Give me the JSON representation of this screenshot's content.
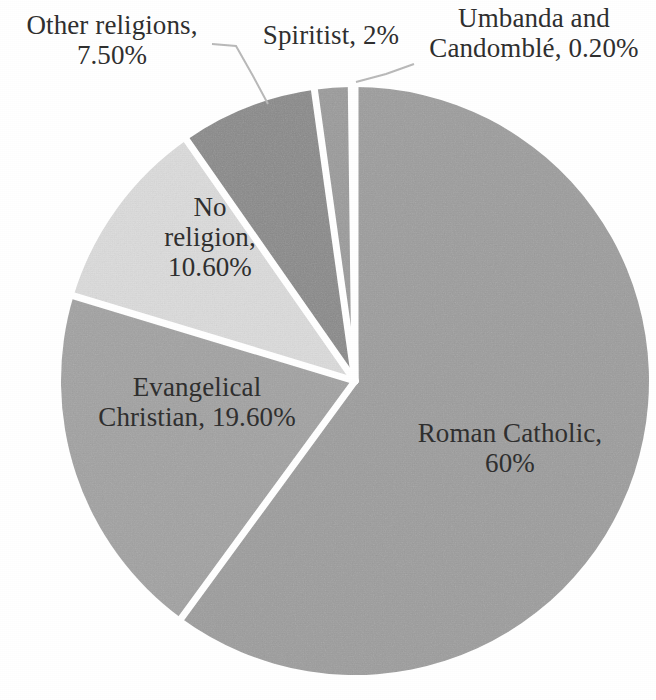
{
  "chart_data": {
    "type": "pie",
    "title": "",
    "subtitle": "",
    "xlabel": "",
    "ylabel": "",
    "legend_position": "none",
    "grid": false,
    "units": "percent",
    "start_angle_deg": 0,
    "direction": "clockwise",
    "categories": [
      "Roman Catholic",
      "Evangelical Christian",
      "No religion",
      "Other religions",
      "Spiritist",
      "Umbanda and Candomblé"
    ],
    "values": [
      60,
      19.6,
      10.6,
      7.5,
      2,
      0.2
    ],
    "slices": [
      {
        "name": "Roman Catholic",
        "value": 60,
        "value_text": "60%",
        "label_text": "Roman Catholic, 60%",
        "label_lines": [
          "Roman Catholic,",
          "60%"
        ],
        "color": "#9d9d9d",
        "label_placement": "inside"
      },
      {
        "name": "Evangelical Christian",
        "value": 19.6,
        "value_text": "19.60%",
        "label_text": "Evangelical Christian, 19.60%",
        "label_lines": [
          "Evangelical",
          "Christian, 19.60%"
        ],
        "color": "#a2a2a2",
        "label_placement": "inside"
      },
      {
        "name": "No religion",
        "value": 10.6,
        "value_text": "10.60%",
        "label_text": "No religion, 10.60%",
        "label_lines": [
          "No",
          "religion,",
          "10.60%"
        ],
        "color": "#dcdcdc",
        "label_placement": "inside"
      },
      {
        "name": "Other religions",
        "value": 7.5,
        "value_text": "7.50%",
        "label_text": "Other religions, 7.50%",
        "label_lines": [
          "Other religions,",
          "7.50%"
        ],
        "color": "#8a8a8a",
        "label_placement": "outside-with-leader"
      },
      {
        "name": "Spiritist",
        "value": 2,
        "value_text": "2%",
        "label_text": "Spiritist, 2%",
        "label_lines": [
          "Spiritist, 2%"
        ],
        "color": "#9b9b9b",
        "label_placement": "outside"
      },
      {
        "name": "Umbanda and Candomblé",
        "value": 0.2,
        "value_text": "0.20%",
        "label_text": "Umbanda and Candomblé, 0.20%",
        "label_lines": [
          "Umbanda and",
          "Candomblé, 0.20%"
        ],
        "color": "#9b9b9b",
        "label_placement": "outside-with-leader"
      }
    ],
    "colors": {
      "background": "#ffffff",
      "slice_separator": "#ffffff",
      "label_text": "#2f2f2f",
      "leader_line": "#b0b0b0"
    }
  },
  "labels": {
    "other_religions": {
      "line1": "Other religions,",
      "line2": "7.50%"
    },
    "spiritist": {
      "line1": "Spiritist, 2%"
    },
    "umbanda": {
      "line1": "Umbanda and",
      "line2": "Candomblé, 0.20%"
    },
    "no_religion": {
      "line1": "No",
      "line2": "religion,",
      "line3": "10.60%"
    },
    "evangelical": {
      "line1": "Evangelical",
      "line2": "Christian, 19.60%"
    },
    "roman_catholic": {
      "line1": "Roman Catholic,",
      "line2": "60%"
    }
  }
}
